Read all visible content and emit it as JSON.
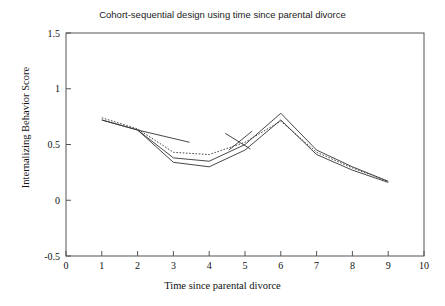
{
  "chart_data": {
    "type": "line",
    "title": "Cohort-sequential design using time since parental divorce",
    "xlabel": "Time since parental divorce",
    "ylabel": "Internalizing Behavior Score",
    "xlim": [
      0,
      10
    ],
    "ylim": [
      -0.5,
      1.5
    ],
    "xticks": [
      0,
      1,
      2,
      3,
      4,
      5,
      6,
      7,
      8,
      9,
      10
    ],
    "yticks": [
      -0.5,
      0,
      0.5,
      1,
      1.5
    ],
    "xtick_labels": [
      "0",
      "1",
      "2",
      "3",
      "4",
      "5",
      "6",
      "7",
      "8",
      "9",
      "10"
    ],
    "ytick_labels": [
      "-0.5",
      "0",
      "0.5",
      "1",
      "1.5"
    ],
    "grid": false,
    "legend": null,
    "series": [
      {
        "name": "overall-trajectory-solid",
        "style": "solid",
        "color": "#333333",
        "x": [
          1,
          2,
          3,
          4,
          5,
          6,
          7,
          8,
          9
        ],
        "y": [
          0.72,
          0.63,
          0.38,
          0.35,
          0.5,
          0.78,
          0.45,
          0.3,
          0.17
        ]
      },
      {
        "name": "overall-trajectory-dotted",
        "style": "dotted",
        "color": "#333333",
        "x": [
          1,
          2,
          3,
          4,
          5,
          6,
          7,
          8,
          9
        ],
        "y": [
          0.74,
          0.64,
          0.43,
          0.41,
          0.52,
          0.71,
          0.43,
          0.29,
          0.17
        ]
      },
      {
        "name": "cohort-trajectory-lower-solid",
        "style": "solid",
        "color": "#333333",
        "x": [
          1,
          2,
          3,
          4,
          5,
          6,
          7,
          8,
          9
        ],
        "y": [
          0.72,
          0.63,
          0.34,
          0.3,
          0.45,
          0.72,
          0.41,
          0.27,
          0.16
        ]
      },
      {
        "name": "cohort-segment-1",
        "style": "solid",
        "color": "#333333",
        "x": [
          2,
          3.45
        ],
        "y": [
          0.63,
          0.52
        ]
      },
      {
        "name": "cohort-segment-2",
        "style": "solid",
        "color": "#333333",
        "x": [
          4.45,
          5.15
        ],
        "y": [
          0.6,
          0.46
        ]
      },
      {
        "name": "cohort-segment-3",
        "style": "solid",
        "color": "#333333",
        "x": [
          4.55,
          5.2
        ],
        "y": [
          0.45,
          0.62
        ]
      }
    ]
  }
}
